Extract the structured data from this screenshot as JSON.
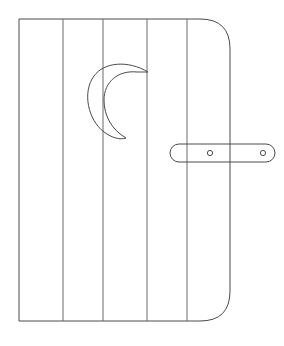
{
  "canvas": {
    "width": 284,
    "height": 346,
    "background_color": "#ffffff"
  },
  "illustration": {
    "title": "Outhouse Door with Crescent Moon",
    "style": "line-art",
    "stroke_color": "#4a4a4a",
    "stroke_width": 1,
    "fill_color": "none"
  },
  "door": {
    "label": "door-panel",
    "x": 19,
    "y": 19,
    "width": 211,
    "height": 302,
    "corner_radius_top_right": 30,
    "corner_radius_bottom_right": 30,
    "corner_radius_top_left": 0,
    "corner_radius_bottom_left": 0,
    "stroke_color": "#4a4a4a"
  },
  "planks": {
    "label": "vertical-plank-seams",
    "count": 4,
    "x_positions": [
      63,
      103,
      147,
      187
    ],
    "y_top": 19,
    "y_bottom": 321,
    "stroke_color": "#6b6b6b"
  },
  "moon": {
    "label": "crescent-moon-cutout",
    "center_x": 120,
    "center_y": 98,
    "outer_radius_x": 28,
    "outer_radius_y": 38,
    "inner_offset_x": 14,
    "stroke_color": "#4a4a4a"
  },
  "handle": {
    "label": "latch-handle",
    "x": 170,
    "y": 144,
    "width": 105,
    "height": 18,
    "corner_radius": 9,
    "stroke_color": "#4a4a4a",
    "screws": [
      {
        "label": "screw-left",
        "cx": 210,
        "cy": 153,
        "r": 2.6
      },
      {
        "label": "screw-right",
        "cx": 263,
        "cy": 153,
        "r": 2.6
      }
    ]
  }
}
